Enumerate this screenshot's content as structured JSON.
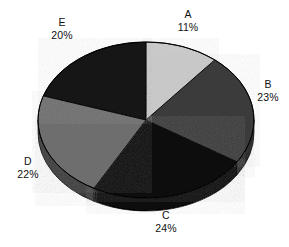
{
  "chart_data": {
    "type": "pie",
    "title": "",
    "subtitle": "",
    "xlabel": "",
    "ylabel": "",
    "legend_position": "none",
    "grid": false,
    "labels_outside": true,
    "start_angle_deg": 0,
    "direction": "clockwise",
    "categories": [
      "A",
      "B",
      "C",
      "D",
      "E"
    ],
    "values": [
      11,
      23,
      24,
      22,
      20
    ],
    "value_unit": "%",
    "slices": [
      {
        "label": "A",
        "value": 11,
        "value_text": "11%",
        "color": "#c9c9c9"
      },
      {
        "label": "B",
        "value": 23,
        "value_text": "23%",
        "color": "#3a3a3a"
      },
      {
        "label": "C",
        "value": 24,
        "value_text": "24%",
        "color": "#0d0d0d"
      },
      {
        "label": "D",
        "value": 22,
        "value_text": "22%",
        "color": "#6e6e6e"
      },
      {
        "label": "E",
        "value": 20,
        "value_text": "20%",
        "color": "#121212"
      }
    ]
  },
  "chart": {
    "background_color": "#ffffff",
    "text_color": "#101010",
    "outline_color": "#000000",
    "side_shadow_color": "#0a0a0a"
  },
  "labels": {
    "A": {
      "name": "A",
      "pct": "11%"
    },
    "B": {
      "name": "B",
      "pct": "23%"
    },
    "C": {
      "name": "C",
      "pct": "24%"
    },
    "D": {
      "name": "D",
      "pct": "22%"
    },
    "E": {
      "name": "E",
      "pct": "20%"
    }
  }
}
